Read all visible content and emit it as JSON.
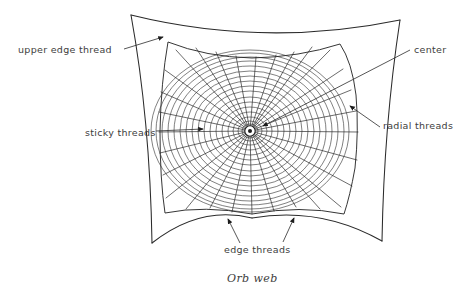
{
  "figure": {
    "caption": "Orb web",
    "background_color": "#ffffff",
    "ink_color": "#3d3d3d"
  },
  "labels": [
    {
      "id": "upper-edge-thread",
      "text": "upper edge thread"
    },
    {
      "id": "center",
      "text": "center"
    },
    {
      "id": "radial-threads",
      "text": "radial threads"
    },
    {
      "id": "sticky-threads",
      "text": "sticky threads"
    },
    {
      "id": "edge-threads",
      "text": "edge threads"
    }
  ],
  "web": {
    "center": {
      "x": 250,
      "y": 131
    },
    "radial_count": 26,
    "spiral_turns": 17,
    "anchors": [
      {
        "name": "top-left",
        "x": 131,
        "y": 15
      },
      {
        "name": "top-right",
        "x": 400,
        "y": 20
      },
      {
        "name": "bottom-left",
        "x": 152,
        "y": 243
      },
      {
        "name": "bottom-right",
        "x": 382,
        "y": 241
      }
    ]
  }
}
